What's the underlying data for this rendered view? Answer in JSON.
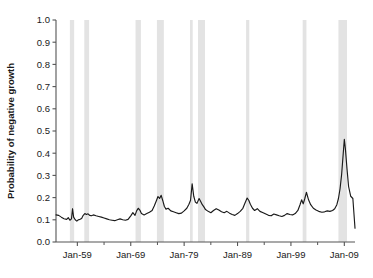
{
  "chart_data": {
    "type": "line",
    "title": "",
    "subtitle": "",
    "xlabel": "",
    "ylabel": "Probability of negative growth",
    "ylim": [
      0.0,
      1.0
    ],
    "xlim": [
      "Jan-1955",
      "Jan-2011"
    ],
    "grid": false,
    "legend_position": "none",
    "y_ticks": [
      "0.0",
      "0.1",
      "0.2",
      "0.3",
      "0.4",
      "0.5",
      "0.6",
      "0.7",
      "0.8",
      "0.9",
      "1.0"
    ],
    "y_tick_values": [
      0.0,
      0.1,
      0.2,
      0.3,
      0.4,
      0.5,
      0.6,
      0.7,
      0.8,
      0.9,
      1.0
    ],
    "x_ticks": [
      "Jan-59",
      "Jan-69",
      "Jan-79",
      "Jan-89",
      "Jan-99",
      "Jan-09"
    ],
    "x_tick_values": [
      1959,
      1969,
      1979,
      1989,
      1999,
      2009
    ],
    "x_minor_tick_values": [
      1964,
      1974,
      1984,
      1994,
      2004
    ],
    "series": [
      {
        "name": "Probability of negative growth",
        "color": "#1a1a1a",
        "x": [
          1955.0,
          1955.5,
          1956.0,
          1956.5,
          1957.0,
          1957.3,
          1957.6,
          1957.9,
          1958.1,
          1958.3,
          1958.6,
          1958.9,
          1959.2,
          1959.5,
          1959.8,
          1960.1,
          1960.4,
          1960.7,
          1961.0,
          1961.3,
          1961.6,
          1962.0,
          1962.5,
          1963.0,
          1963.5,
          1964.0,
          1964.5,
          1965.0,
          1965.5,
          1966.0,
          1966.5,
          1967.0,
          1967.5,
          1968.0,
          1968.5,
          1969.0,
          1969.4,
          1969.8,
          1970.1,
          1970.4,
          1970.7,
          1971.0,
          1971.5,
          1972.0,
          1972.5,
          1973.0,
          1973.4,
          1973.8,
          1974.1,
          1974.4,
          1974.7,
          1975.0,
          1975.3,
          1975.6,
          1976.0,
          1976.5,
          1977.0,
          1977.5,
          1978.0,
          1978.5,
          1979.0,
          1979.5,
          1979.9,
          1980.2,
          1980.5,
          1980.8,
          1981.1,
          1981.4,
          1981.8,
          1982.1,
          1982.4,
          1982.7,
          1983.0,
          1983.5,
          1984.0,
          1984.5,
          1985.0,
          1985.5,
          1986.0,
          1986.5,
          1987.0,
          1987.5,
          1988.0,
          1988.5,
          1989.0,
          1989.5,
          1990.0,
          1990.4,
          1990.8,
          1991.1,
          1991.4,
          1991.8,
          1992.2,
          1992.7,
          1993.2,
          1993.8,
          1994.3,
          1994.8,
          1995.3,
          1995.8,
          1996.3,
          1996.8,
          1997.3,
          1997.8,
          1998.3,
          1998.8,
          1999.3,
          1999.8,
          2000.3,
          2000.7,
          2001.0,
          2001.3,
          2001.6,
          2001.9,
          2002.3,
          2002.7,
          2003.2,
          2003.7,
          2004.2,
          2004.8,
          2005.3,
          2005.8,
          2006.3,
          2006.8,
          2007.2,
          2007.6,
          2007.9,
          2008.2,
          2008.5,
          2008.8,
          2009.0,
          2009.2,
          2009.5,
          2009.8,
          2010.2,
          2010.6,
          2011.0
        ],
        "y": [
          0.122,
          0.12,
          0.112,
          0.105,
          0.102,
          0.11,
          0.098,
          0.104,
          0.15,
          0.112,
          0.1,
          0.094,
          0.1,
          0.102,
          0.106,
          0.12,
          0.128,
          0.124,
          0.127,
          0.12,
          0.118,
          0.122,
          0.118,
          0.115,
          0.112,
          0.108,
          0.104,
          0.1,
          0.098,
          0.096,
          0.1,
          0.104,
          0.1,
          0.098,
          0.102,
          0.118,
          0.132,
          0.12,
          0.14,
          0.152,
          0.144,
          0.128,
          0.122,
          0.128,
          0.134,
          0.142,
          0.162,
          0.186,
          0.205,
          0.196,
          0.21,
          0.186,
          0.16,
          0.148,
          0.152,
          0.14,
          0.136,
          0.132,
          0.128,
          0.13,
          0.14,
          0.152,
          0.17,
          0.188,
          0.262,
          0.206,
          0.18,
          0.174,
          0.196,
          0.182,
          0.168,
          0.158,
          0.146,
          0.138,
          0.132,
          0.142,
          0.15,
          0.144,
          0.136,
          0.132,
          0.138,
          0.13,
          0.124,
          0.12,
          0.128,
          0.138,
          0.152,
          0.176,
          0.198,
          0.188,
          0.17,
          0.152,
          0.142,
          0.15,
          0.138,
          0.132,
          0.126,
          0.12,
          0.118,
          0.126,
          0.122,
          0.118,
          0.115,
          0.12,
          0.128,
          0.124,
          0.122,
          0.128,
          0.142,
          0.168,
          0.19,
          0.172,
          0.196,
          0.224,
          0.19,
          0.168,
          0.152,
          0.144,
          0.138,
          0.134,
          0.136,
          0.14,
          0.138,
          0.142,
          0.15,
          0.168,
          0.196,
          0.24,
          0.305,
          0.4,
          0.462,
          0.42,
          0.33,
          0.25,
          0.206,
          0.196,
          0.062
        ]
      }
    ],
    "recession_bands": [
      {
        "start": 1957.6,
        "end": 1958.4,
        "label": "1957-58"
      },
      {
        "start": 1960.3,
        "end": 1961.2,
        "label": "1960-61"
      },
      {
        "start": 1969.9,
        "end": 1970.9,
        "label": "1969-70"
      },
      {
        "start": 1973.9,
        "end": 1975.2,
        "label": "1973-75"
      },
      {
        "start": 1980.1,
        "end": 1980.6,
        "label": "1980"
      },
      {
        "start": 1981.6,
        "end": 1982.9,
        "label": "1981-82"
      },
      {
        "start": 1990.6,
        "end": 1991.2,
        "label": "1990-91"
      },
      {
        "start": 2001.2,
        "end": 2001.9,
        "label": "2001"
      },
      {
        "start": 2007.9,
        "end": 2009.5,
        "label": "2007-09"
      }
    ],
    "recession_band_color": "#e3e3e3",
    "axis_color": "#555555",
    "line_color": "#1a1a1a",
    "background_color": "#ffffff"
  }
}
